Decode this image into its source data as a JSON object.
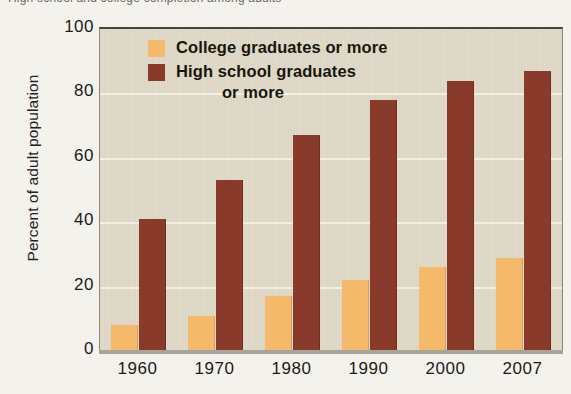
{
  "caption": {
    "text": "High school and college completion among adults"
  },
  "chart_data": {
    "type": "bar",
    "title": "",
    "xlabel": "",
    "ylabel": "Percent of adult population",
    "ylim": [
      0,
      100
    ],
    "yticks": [
      100,
      80,
      60,
      40,
      20,
      0
    ],
    "grid": true,
    "legend_position": "top-left-inside",
    "categories": [
      "1960",
      "1970",
      "1980",
      "1990",
      "2000",
      "2007"
    ],
    "series": [
      {
        "name": "College graduates or more",
        "color": "#f5b96b",
        "values": [
          8,
          11,
          17,
          22,
          26,
          29
        ]
      },
      {
        "name": "High school graduates or more",
        "color": "#8a3a2a",
        "values": [
          41,
          53,
          67,
          78,
          84,
          87
        ]
      }
    ]
  },
  "legend": {
    "entries": [
      {
        "label": "College graduates or more",
        "swatch": "college",
        "second_line": ""
      },
      {
        "label": "High school graduates",
        "swatch": "highschool",
        "second_line": "or more"
      }
    ]
  },
  "colors": {
    "plot_background": "#ddd6c4",
    "page_background": "#f4f2ed",
    "gridline": "#f6f2e8",
    "axis": "#46433d",
    "college": "#f5b96b",
    "highschool": "#8a3a2a"
  }
}
